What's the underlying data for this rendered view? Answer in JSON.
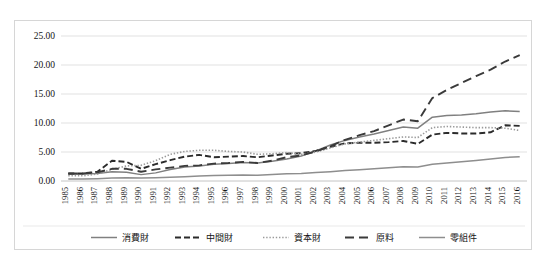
{
  "chart_data": {
    "type": "line",
    "title": "",
    "xlabel": "",
    "ylabel": "",
    "ylim": [
      0,
      25
    ],
    "ytick_step": 5,
    "ytick_labels": [
      "0.00",
      "5.00",
      "10.00",
      "15.00",
      "20.00",
      "25.00"
    ],
    "grid": true,
    "legend_position": "bottom",
    "categories": [
      "1985",
      "1986",
      "1987",
      "1988",
      "1989",
      "1990",
      "1991",
      "1992",
      "1993",
      "1994",
      "1995",
      "1996",
      "1997",
      "1998",
      "1999",
      "2000",
      "2001",
      "2002",
      "2003",
      "2004",
      "2005",
      "2006",
      "2007",
      "2008",
      "2009",
      "2010",
      "2011",
      "2012",
      "2013",
      "2014",
      "2015",
      "2016"
    ],
    "series": [
      {
        "name": "消費財",
        "style": "solid",
        "color": "#808080",
        "values": [
          1.2,
          1.2,
          1.3,
          1.6,
          1.5,
          1.1,
          1.4,
          2.0,
          2.4,
          2.6,
          2.9,
          3.0,
          3.2,
          3.1,
          3.4,
          3.8,
          4.3,
          5.2,
          6.2,
          7.0,
          7.6,
          8.1,
          8.7,
          9.3,
          9.1,
          11.0,
          11.3,
          11.4,
          11.6,
          11.9,
          12.1,
          12.0
        ]
      },
      {
        "name": "中間財",
        "style": "dashed",
        "color": "#2b2b2b",
        "values": [
          1.3,
          1.3,
          1.6,
          3.5,
          3.3,
          2.1,
          2.9,
          3.6,
          4.2,
          4.5,
          4.1,
          4.2,
          4.3,
          4.1,
          4.4,
          4.7,
          4.8,
          5.2,
          5.9,
          6.5,
          6.6,
          6.6,
          6.7,
          6.9,
          6.4,
          8.0,
          8.3,
          8.2,
          8.2,
          8.4,
          9.6,
          9.5
        ]
      },
      {
        "name": "資本財",
        "style": "dotted",
        "color": "#9a9a9a",
        "values": [
          0.9,
          0.9,
          1.2,
          2.0,
          2.6,
          2.7,
          3.5,
          4.6,
          5.1,
          5.3,
          5.3,
          5.1,
          5.0,
          4.6,
          4.7,
          4.9,
          4.6,
          5.0,
          5.7,
          6.4,
          6.7,
          7.0,
          7.3,
          7.6,
          7.5,
          9.2,
          9.4,
          9.3,
          9.2,
          9.2,
          9.1,
          8.7
        ]
      },
      {
        "name": "原料",
        "style": "longdash",
        "color": "#3a3a3a",
        "values": [
          1.3,
          1.3,
          1.5,
          2.1,
          2.1,
          1.6,
          2.0,
          2.3,
          2.6,
          2.7,
          3.0,
          3.1,
          3.3,
          3.1,
          3.5,
          4.1,
          4.4,
          5.1,
          6.0,
          7.1,
          7.9,
          8.6,
          9.6,
          10.6,
          10.3,
          14.3,
          15.7,
          16.9,
          18.1,
          19.2,
          20.6,
          21.7
        ]
      },
      {
        "name": "零組件",
        "style": "solid",
        "color": "#8e8e8e",
        "values": [
          0.35,
          0.35,
          0.4,
          0.5,
          0.55,
          0.5,
          0.55,
          0.65,
          0.75,
          0.85,
          0.95,
          1.0,
          1.05,
          1.0,
          1.1,
          1.25,
          1.3,
          1.45,
          1.6,
          1.8,
          1.95,
          2.1,
          2.3,
          2.45,
          2.4,
          2.9,
          3.1,
          3.3,
          3.55,
          3.8,
          4.05,
          4.2
        ]
      }
    ]
  },
  "legend": {
    "items": [
      {
        "label": "消費財",
        "style": "solid",
        "color": "#808080"
      },
      {
        "label": "中間財",
        "style": "dashed",
        "color": "#2b2b2b"
      },
      {
        "label": "資本財",
        "style": "dotted",
        "color": "#9a9a9a"
      },
      {
        "label": "原料",
        "style": "longdash",
        "color": "#3a3a3a"
      },
      {
        "label": "零組件",
        "style": "solid",
        "color": "#8e8e8e"
      }
    ]
  },
  "colors": {
    "frame_border": "#d6d6d6",
    "gridline": "#d9d9d9",
    "background": "#ffffff",
    "text": "#141414"
  }
}
